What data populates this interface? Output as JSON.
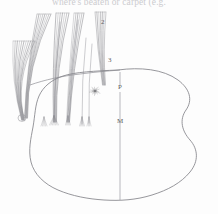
{
  "page": {
    "width": 218,
    "height": 214,
    "background_color": "#fdfdfd",
    "header_text_fragment": "where's beaten or carpet (e.g.",
    "figure_kind": "line-drawing-diagram"
  },
  "colors": {
    "ink": "#6e6e73",
    "ink_light": "#9a9aa0",
    "hair_stroke": "#8a8a90",
    "label_text": "#5d5d62",
    "header_text": "#b9b9bd",
    "outline": "#84848a"
  },
  "labels": [
    {
      "id": "label-2",
      "text": "2",
      "x": 101,
      "y": 19
    },
    {
      "id": "label-3",
      "text": "3",
      "x": 108,
      "y": 57
    },
    {
      "id": "label-p",
      "text": "P",
      "x": 118,
      "y": 84
    },
    {
      "id": "label-m",
      "text": "M",
      "x": 117,
      "y": 118
    }
  ],
  "figure": {
    "body_outline": {
      "name": "body-outline",
      "description": "large irregular rounded blob occupying lower two thirds",
      "path": "M 118 70 C 140 67 163 69 178 80 C 190 89 193 100 186 110 C 179 120 182 131 190 140 C 198 149 199 161 190 172 C 181 183 168 190 152 195 C 136 200 120 201 104 200 C 88 199 72 196 58 190 C 44 184 34 174 31 162 C 28 150 31 138 33 127 C 35 116 35 105 39 96 C 43 87 51 80 63 76 C 75 72 95 71 118 70 Z"
    },
    "midline": {
      "name": "midline-axis",
      "x": 120,
      "y_top": 72,
      "y_bottom": 200
    },
    "midline_gap": {
      "y_from": 86,
      "y_to": 92
    },
    "ridge_line": {
      "name": "upper-ridge-line",
      "path": "M 30 85 C 44 80 62 76 80 74 C 95 72 108 71 120 70"
    },
    "starburst": {
      "name": "starburst-rosette",
      "cx": 95,
      "cy": 91,
      "rays": 26,
      "r_min": 2,
      "r_max": 7
    },
    "hook": {
      "name": "left-convergence-hook",
      "cx": 22,
      "cy": 118,
      "r": 4
    },
    "bundles": [
      {
        "name": "hair-bundle-1",
        "top_x": 13,
        "top_y": 41,
        "top_w": 22,
        "count": 11,
        "tip_x": 23,
        "tip_y": 120,
        "bow": 16
      },
      {
        "name": "hair-bundle-2",
        "top_x": 37,
        "top_y": 14,
        "top_w": 14,
        "count": 8,
        "tip_x": 26,
        "tip_y": 118,
        "bow": 14
      },
      {
        "name": "hair-bundle-3",
        "top_x": 56,
        "top_y": 13,
        "top_w": 13,
        "count": 7,
        "tip_x": 55,
        "tip_y": 122,
        "bow": 8
      },
      {
        "name": "hair-bundle-4",
        "top_x": 74,
        "top_y": 13,
        "top_w": 10,
        "count": 6,
        "tip_x": 68,
        "tip_y": 122,
        "bow": 5
      },
      {
        "name": "hair-bundle-5",
        "top_x": 95,
        "top_y": 12,
        "top_w": 11,
        "count": 7,
        "tip_x": 104,
        "tip_y": 85,
        "bow": 3
      }
    ],
    "tufts": [
      {
        "name": "tuft-a",
        "x": 54,
        "y": 123,
        "spread": 9,
        "count": 7
      },
      {
        "name": "tuft-b",
        "x": 68,
        "y": 123,
        "spread": 5,
        "count": 5
      },
      {
        "name": "tuft-c",
        "x": 82,
        "y": 124,
        "spread": 5,
        "count": 5
      },
      {
        "name": "tuft-d",
        "x": 89,
        "y": 124,
        "spread": 4,
        "count": 4
      },
      {
        "name": "tuft-e",
        "x": 44,
        "y": 124,
        "spread": 6,
        "count": 5
      }
    ],
    "long_hairs": [
      {
        "name": "long-hair-1",
        "x1": 60,
        "y1": 22,
        "x2": 54,
        "y2": 122
      },
      {
        "name": "long-hair-2",
        "x1": 78,
        "y1": 20,
        "x2": 69,
        "y2": 122
      },
      {
        "name": "long-hair-3",
        "x1": 86,
        "y1": 38,
        "x2": 82,
        "y2": 124
      },
      {
        "name": "long-hair-4",
        "x1": 92,
        "y1": 44,
        "x2": 89,
        "y2": 123
      }
    ]
  }
}
